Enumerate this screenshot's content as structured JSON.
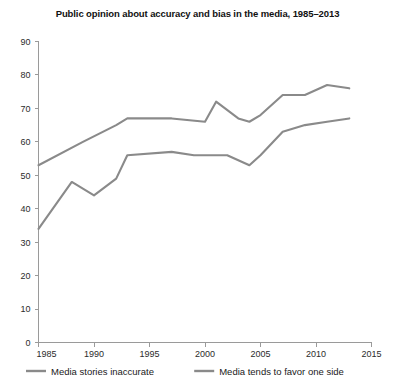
{
  "chart_data": {
    "type": "line",
    "title": "Public opinion about accuracy and bias in the media, 1985–2013",
    "xlabel": "",
    "ylabel": "",
    "xlim": [
      1985,
      2015
    ],
    "ylim": [
      0,
      90
    ],
    "grid": false,
    "legend_position": "bottom",
    "x_ticks": [
      "1985",
      "1990",
      "1995",
      "2000",
      "2005",
      "2010",
      "2015"
    ],
    "y_ticks": [
      "0",
      "10",
      "20",
      "30",
      "40",
      "50",
      "60",
      "70",
      "80",
      "90"
    ],
    "series": [
      {
        "name": "Media tends to favor one side",
        "color": "#8a8a8a",
        "x": [
          1985,
          1989,
          1992,
          1993,
          1997,
          2000,
          2001,
          2003,
          2004,
          2005,
          2007,
          2009,
          2011,
          2013
        ],
        "values": [
          53,
          60,
          65,
          67,
          67,
          66,
          72,
          67,
          66,
          68,
          74,
          74,
          77,
          76
        ]
      },
      {
        "name": "Media stories inaccurate",
        "color": "#8a8a8a",
        "x": [
          1985,
          1988,
          1990,
          1992,
          1993,
          1997,
          1999,
          2002,
          2004,
          2005,
          2007,
          2009,
          2011,
          2013
        ],
        "values": [
          34,
          48,
          44,
          49,
          56,
          57,
          56,
          56,
          53,
          56,
          63,
          65,
          66,
          67
        ]
      }
    ]
  },
  "legend": {
    "entries": [
      {
        "label": "Media stories inaccurate",
        "color": "#8a8a8a"
      },
      {
        "label": "Media tends to favor one side",
        "color": "#8a8a8a"
      }
    ]
  }
}
